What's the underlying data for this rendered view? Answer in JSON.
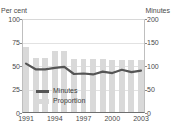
{
  "chart_data": {
    "type": "bar",
    "title": "",
    "xlabel": "",
    "ylabel": "Per cent",
    "y2label": "Minutes",
    "grid": true,
    "legend_position": "inside-bottom-left",
    "x": [
      1991,
      1992,
      1993,
      1994,
      1995,
      1996,
      1997,
      1998,
      1999,
      2000,
      2001,
      2002,
      2003
    ],
    "categories": [
      "1991",
      "1992",
      "1993",
      "1994",
      "1995",
      "1996",
      "1997",
      "1998",
      "1999",
      "2000",
      "2001",
      "2002",
      "2003"
    ],
    "xtick_labels": [
      "1991",
      "1994",
      "1997",
      "2000",
      "2003"
    ],
    "xtick_values": [
      1991,
      1994,
      1997,
      2000,
      2003
    ],
    "ylim": [
      0,
      100
    ],
    "ytick_labels": [
      "0",
      "25",
      "50",
      "75",
      "100"
    ],
    "ytick_values": [
      0,
      25,
      50,
      75,
      100
    ],
    "y2lim": [
      0,
      200
    ],
    "y2tick_labels": [
      "0",
      "50",
      "100",
      "150",
      "200"
    ],
    "y2tick_values": [
      0,
      50,
      100,
      150,
      200
    ],
    "series": [
      {
        "name": "Proportion",
        "type": "bar",
        "axis": "left",
        "unit": "per cent",
        "color": "#d9d9d9",
        "values": [
          70,
          59,
          59,
          66,
          66,
          57,
          57,
          57,
          57,
          56,
          56,
          56,
          56
        ]
      },
      {
        "name": "Minutes",
        "type": "line",
        "axis": "right",
        "unit": "minutes",
        "color": "#555555",
        "values": [
          105,
          93,
          93,
          96,
          98,
          83,
          84,
          82,
          88,
          85,
          92,
          87,
          90
        ]
      }
    ]
  },
  "axes": {
    "left_caption": "Per cent",
    "right_caption": "Minutes"
  },
  "legend": {
    "items": [
      {
        "label": "Minutes",
        "marker": "line",
        "color": "#555555"
      },
      {
        "label": "Proportion",
        "marker": "bar",
        "color": "#d9d9d9"
      }
    ]
  },
  "colors": {
    "bar": "#d9d9d9",
    "line": "#555555",
    "grid": "#e2e2e2",
    "axis": "#6f6f6f",
    "text": "#3b3b3b"
  }
}
